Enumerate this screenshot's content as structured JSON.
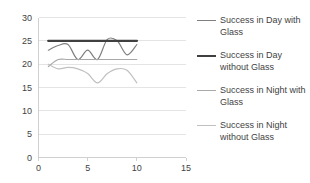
{
  "chart_data": {
    "type": "line",
    "title": "",
    "xlabel": "",
    "ylabel": "",
    "xlim": [
      0,
      15
    ],
    "ylim": [
      0,
      30
    ],
    "x_ticks": [
      0,
      5,
      10,
      15
    ],
    "y_ticks": [
      0,
      5,
      10,
      15,
      20,
      25,
      30
    ],
    "grid": true,
    "grid_axis": "y",
    "legend_position": "right",
    "x": [
      1,
      2,
      3,
      4,
      5,
      6,
      7,
      8,
      9,
      10
    ],
    "series": [
      {
        "name": "Success in Day with Glass",
        "color": "#808080",
        "width": 1.2,
        "values": [
          23,
          24,
          24.2,
          21,
          23,
          21,
          25.3,
          25,
          22,
          24.2
        ]
      },
      {
        "name": "Success in Day without Glass",
        "color": "#404040",
        "width": 2.4,
        "values": [
          25,
          25,
          25,
          25,
          25,
          25,
          25,
          25,
          25,
          25
        ]
      },
      {
        "name": "Success in Night with Glass",
        "color": "#a8a8a8",
        "width": 1.2,
        "values": [
          19.5,
          21,
          21,
          21,
          21,
          21,
          21,
          21,
          21,
          21
        ]
      },
      {
        "name": "Success in Night without Glass",
        "color": "#c0c0c0",
        "width": 1.2,
        "values": [
          20,
          19,
          19.3,
          19,
          18,
          16,
          18,
          19,
          18.7,
          16
        ]
      }
    ]
  },
  "axes": {
    "y_tick_labels": [
      "30",
      "25",
      "20",
      "15",
      "10",
      "5",
      "0"
    ],
    "x_tick_labels": [
      "0",
      "5",
      "10",
      "15"
    ]
  },
  "legend": {
    "items": [
      {
        "label": "Success in Day with Glass",
        "color": "#808080"
      },
      {
        "label": "Success in Day without Glass",
        "color": "#404040"
      },
      {
        "label": "Success in Night with Glass",
        "color": "#a8a8a8"
      },
      {
        "label": "Success in Night without Glass",
        "color": "#c0c0c0"
      }
    ]
  },
  "style": {
    "background": "#ffffff",
    "gridline_color": "#e4e4e4",
    "axis_color": "#d0d0d0",
    "text_color": "#3f3f3f"
  }
}
